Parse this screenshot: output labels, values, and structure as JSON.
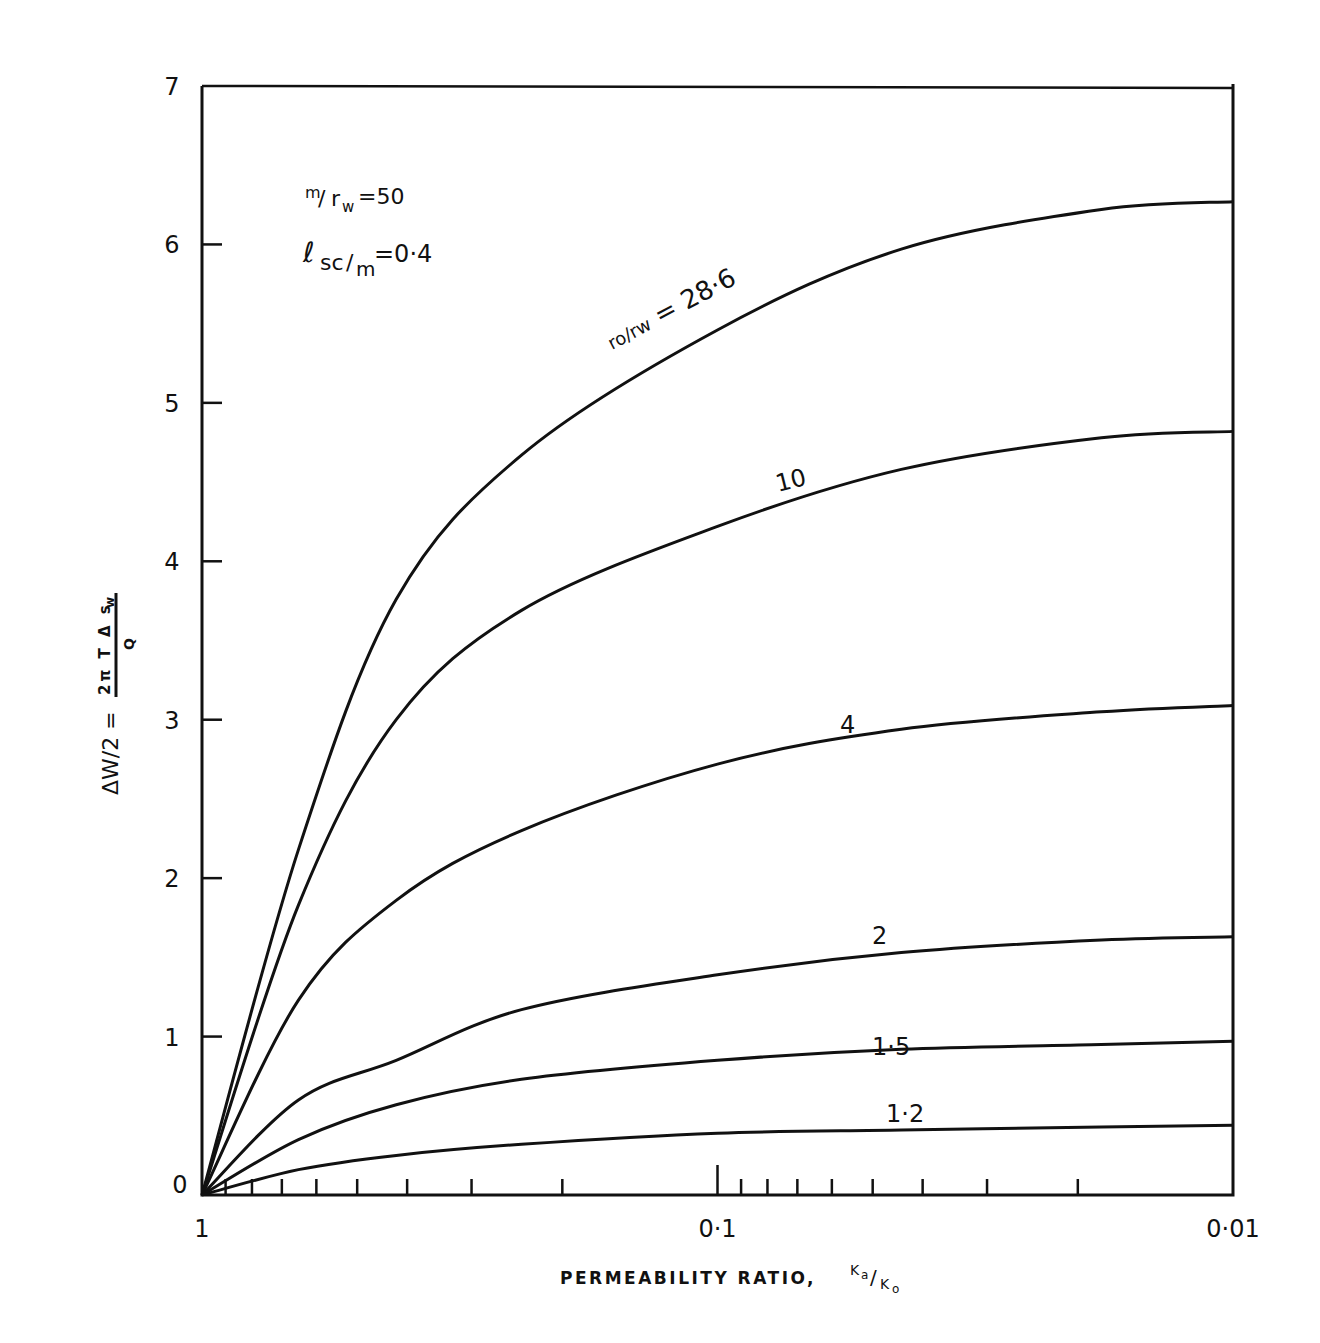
{
  "chart_data": {
    "type": "line",
    "title": "",
    "xlabel": "PERMEABILITY RATIO, Ka/Ko",
    "xlabel_main": "PERMEABILITY RATIO\u0005",
    "xlabel_frac_num": "K",
    "xlabel_frac_num_sub": "a",
    "xlabel_frac_den": "K",
    "xlabel_frac_den_sub": "o",
    "ylabel": "ΔW/2 = 2πTΔsw / Q",
    "ylabel_left": "ΔW/2 =",
    "ylabel_num": "2π T Δ s",
    "ylabel_num_sub": "w",
    "ylabel_den": "Q",
    "x_scale": "log",
    "x_reversed": true,
    "xlim": [
      1,
      0.01
    ],
    "ylim": [
      0,
      7
    ],
    "x_tick_labels": [
      "1",
      "0·1",
      "0·01"
    ],
    "x_tick_values": [
      1,
      0.1,
      0.01
    ],
    "y_tick_labels": [
      "0",
      "1",
      "2",
      "3",
      "4",
      "5",
      "6",
      "7"
    ],
    "y_tick_values": [
      0,
      1,
      2,
      3,
      4,
      5,
      6,
      7
    ],
    "grid": false,
    "annotations": [
      {
        "text": "m/rw = 50",
        "num": "m",
        "den": "r",
        "den_sub": "w",
        "value": "=50"
      },
      {
        "text": "lsc/m = 0·4",
        "num": "ℓ",
        "num_sub": "sc",
        "den": "m",
        "value": "=0·4"
      }
    ],
    "legend_position": "inline labels on curves",
    "x": [
      1,
      0.65,
      0.42,
      0.24,
      0.1,
      0.044,
      0.018,
      0.01
    ],
    "series": [
      {
        "name": "ro/rw = 28·6",
        "label": "rₐ/rₓ = 28·6",
        "values": [
          0,
          2.18,
          3.76,
          4.67,
          5.46,
          5.97,
          6.22,
          6.27
        ]
      },
      {
        "name": "10",
        "label": "10",
        "values": [
          0,
          1.83,
          3.0,
          3.69,
          4.22,
          4.58,
          4.78,
          4.82
        ]
      },
      {
        "name": "4",
        "label": "4",
        "values": [
          0,
          1.23,
          1.86,
          2.3,
          2.72,
          2.94,
          3.05,
          3.09
        ]
      },
      {
        "name": "2",
        "label": "2",
        "values": [
          0,
          0.6,
          0.85,
          1.17,
          1.39,
          1.53,
          1.61,
          1.63
        ]
      },
      {
        "name": "1·5",
        "label": "1·5",
        "values": [
          0,
          0.35,
          0.57,
          0.73,
          0.85,
          0.92,
          0.95,
          0.97
        ]
      },
      {
        "name": "1·2",
        "label": "1·2",
        "values": [
          0,
          0.16,
          0.25,
          0.32,
          0.39,
          0.41,
          0.43,
          0.44
        ]
      }
    ]
  }
}
